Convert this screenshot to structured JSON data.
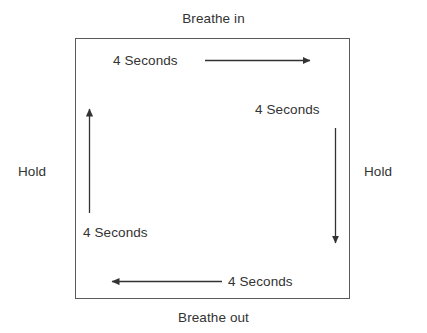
{
  "diagram": {
    "colors": {
      "box_border": "#5a5a5a",
      "text": "#333333",
      "arrow": "#333333",
      "background": "#ffffff"
    },
    "outer_labels": {
      "top": "Breathe in",
      "bottom": "Breathe out",
      "left": "Hold",
      "right": "Hold"
    },
    "duration_labels": {
      "top": "4 Seconds",
      "right": "4 Seconds",
      "left": "4 Seconds",
      "bottom": "4 Seconds"
    },
    "arrows": [
      {
        "name": "arrow-top-right",
        "direction": "right",
        "phase": "Breathe in",
        "duration": "4 Seconds"
      },
      {
        "name": "arrow-right-down",
        "direction": "down",
        "phase": "Hold",
        "duration": "4 Seconds"
      },
      {
        "name": "arrow-bottom-left",
        "direction": "left",
        "phase": "Breathe out",
        "duration": "4 Seconds"
      },
      {
        "name": "arrow-left-up",
        "direction": "up",
        "phase": "Hold",
        "duration": "4 Seconds"
      }
    ]
  }
}
